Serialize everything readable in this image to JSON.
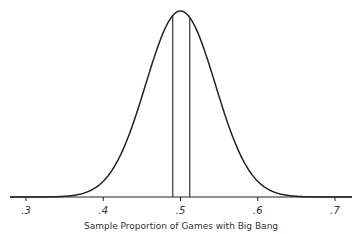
{
  "chart_data": {
    "type": "line",
    "title": "",
    "xlabel": "Sample Proportion of Games with Big Bang",
    "ylabel": "",
    "distribution": {
      "mean": 0.5,
      "sd": 0.045
    },
    "xlim": [
      0.28,
      0.71
    ],
    "x_ticks": [
      0.3,
      0.4,
      0.5,
      0.6,
      0.7
    ],
    "x_tick_labels": [
      ".3",
      ".4",
      ".5",
      ".6",
      ".7"
    ],
    "vertical_lines": [
      0.49,
      0.512
    ],
    "grid": false,
    "legend": null
  }
}
